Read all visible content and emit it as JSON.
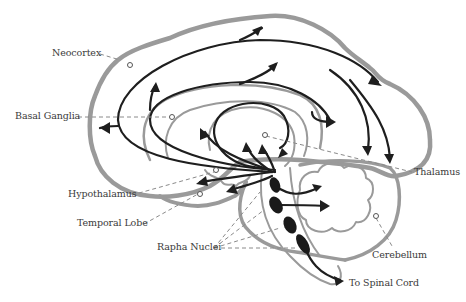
{
  "diagram": {
    "type": "anatomical-illustration",
    "colors": {
      "brain_outline": "#9a9a9a",
      "pathway_arrows": "#1e1e1e",
      "label_text": "#3a3a3a",
      "leader_lines": "#8a8a8a",
      "background": "#ffffff"
    },
    "labels": {
      "neocortex": "Neocortex",
      "basal_ganglia": "Basal Ganglia",
      "thalamus": "Thalamus",
      "hypothalamus": "Hypothalamus",
      "temporal_lobe": "Temporal Lobe",
      "rapha_nuclei": "Rapha Nuclei",
      "cerebellum": "Cerebellum",
      "spinal_cord": "To Spinal Cord"
    }
  }
}
